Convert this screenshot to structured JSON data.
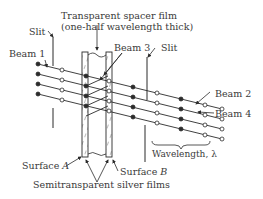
{
  "labels": {
    "spacer_line1": "Transparent spacer film",
    "spacer_line2": "(one-half wavelength thick)",
    "slit_left": "Slit",
    "slit_right": "Slit",
    "beam1": "Beam 1",
    "beam2": "Beam 2",
    "beam3": "Beam 3",
    "beam4": "Beam 4",
    "surface_a_prefix": "Surface ",
    "surface_a_letter": "A",
    "surface_b_prefix": "Surface ",
    "surface_b_letter": "B",
    "silver_films": "Semitransparent silver films",
    "wavelength": "Wavelength, λ"
  },
  "colors": {
    "ink": "#2b2b2b",
    "background": "#ffffff"
  }
}
